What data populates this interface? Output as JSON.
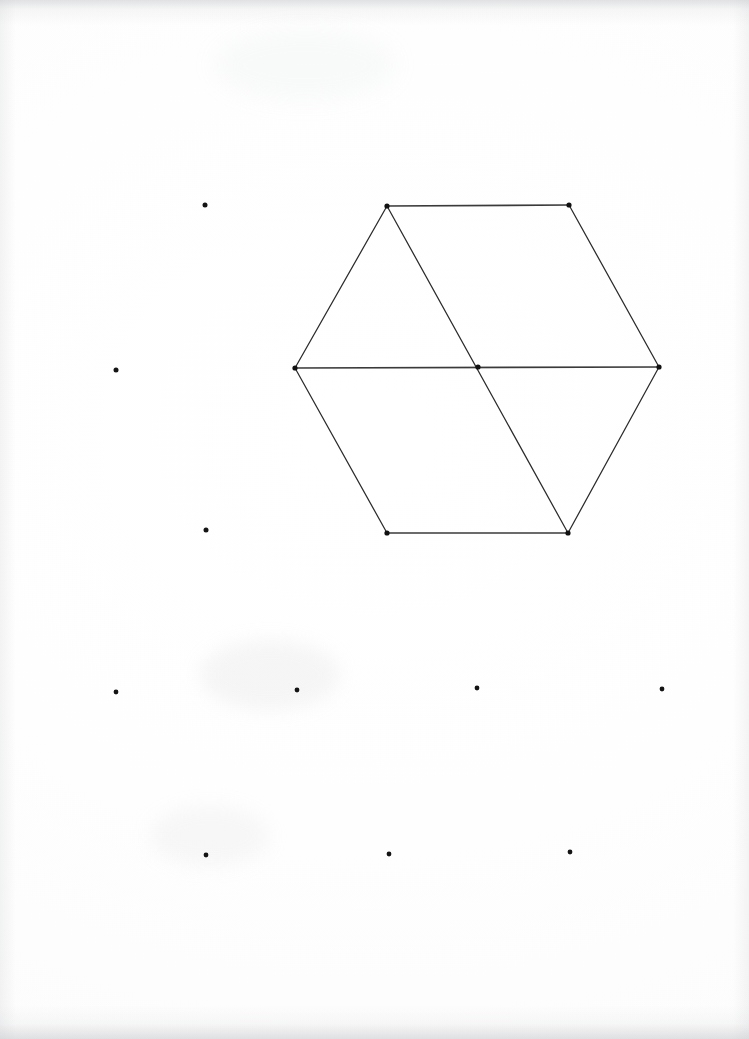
{
  "document": {
    "kind": "scanned-dot-grid-paper-drawing",
    "title": "Hand-drawn hexagon with internal horizontal and diagonal lines on dot-grid paper",
    "width": 749,
    "height": 1039,
    "background_color": "#ffffff",
    "ink_color": "#2b2b2b",
    "dot_color": "#141414"
  },
  "chart_data": {
    "type": "scatter",
    "subtitle": "",
    "xlabel": "",
    "ylabel": "",
    "xlim": [
      0,
      749
    ],
    "ylim": [
      1039,
      0
    ],
    "grid": false,
    "legend_position": "none",
    "annotations": [],
    "grid_spacing": {
      "x": 181,
      "y": 162
    },
    "series": [
      {
        "name": "hexagon-vertices",
        "marker": "dot",
        "color": "#111111",
        "points": [
          {
            "label": "top-left",
            "x": 387,
            "y": 206
          },
          {
            "label": "top-right",
            "x": 569,
            "y": 205
          },
          {
            "label": "middle-right",
            "x": 659,
            "y": 367
          },
          {
            "label": "bottom-right",
            "x": 568,
            "y": 533
          },
          {
            "label": "bottom-left",
            "x": 387,
            "y": 533
          },
          {
            "label": "middle-left",
            "x": 295,
            "y": 368
          }
        ]
      },
      {
        "name": "interior-intersection",
        "marker": "dot",
        "color": "#111111",
        "points": [
          {
            "label": "center",
            "x": 478,
            "y": 367
          }
        ]
      },
      {
        "name": "loose-grid-dots",
        "marker": "dot",
        "color": "#141414",
        "points": [
          {
            "label": "r1c2",
            "x": 205,
            "y": 205
          },
          {
            "label": "r2c1",
            "x": 116,
            "y": 370
          },
          {
            "label": "r3c2",
            "x": 206,
            "y": 530
          },
          {
            "label": "r4c1",
            "x": 116,
            "y": 692
          },
          {
            "label": "r4c2",
            "x": 297,
            "y": 690
          },
          {
            "label": "r4c3",
            "x": 477,
            "y": 688
          },
          {
            "label": "r4c4",
            "x": 662,
            "y": 689
          },
          {
            "label": "r5c2",
            "x": 206,
            "y": 855
          },
          {
            "label": "r5c3",
            "x": 389,
            "y": 854
          },
          {
            "label": "r5c4",
            "x": 570,
            "y": 852
          }
        ]
      }
    ],
    "lines": [
      {
        "name": "edge-top",
        "from": [
          387,
          206
        ],
        "to": [
          569,
          205
        ]
      },
      {
        "name": "edge-upper-right",
        "from": [
          569,
          205
        ],
        "to": [
          659,
          367
        ]
      },
      {
        "name": "edge-lower-right",
        "from": [
          659,
          367
        ],
        "to": [
          568,
          533
        ]
      },
      {
        "name": "edge-bottom",
        "from": [
          568,
          533
        ],
        "to": [
          387,
          533
        ]
      },
      {
        "name": "edge-lower-left",
        "from": [
          387,
          533
        ],
        "to": [
          295,
          368
        ]
      },
      {
        "name": "edge-upper-left",
        "from": [
          295,
          368
        ],
        "to": [
          387,
          206
        ]
      },
      {
        "name": "chord-horizontal",
        "from": [
          295,
          368
        ],
        "to": [
          659,
          367
        ]
      },
      {
        "name": "chord-diagonal",
        "from": [
          387,
          206
        ],
        "to": [
          568,
          533
        ]
      }
    ]
  },
  "figure": {
    "shape_name": "hexagon",
    "vertex_count": 6,
    "interior_line_count": 2,
    "loose_dot_count": 10
  }
}
